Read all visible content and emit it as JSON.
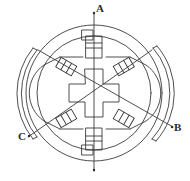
{
  "figure": {
    "kind": "engineering-cross-section",
    "background_color": "#ffffff",
    "line_color": "#3a3a3a",
    "label_color": "#2b2b2b"
  },
  "labels": {
    "a": "A",
    "b": "B",
    "c": "C"
  },
  "axes": [
    {
      "name": "A",
      "label": "A",
      "orientation": "vertical",
      "angle_deg": 90,
      "label_position": "top"
    },
    {
      "name": "B",
      "label": "B",
      "orientation": "diagonal",
      "angle_deg": -30,
      "label_position": "lower-right"
    },
    {
      "name": "C",
      "label": "C",
      "orientation": "diagonal",
      "angle_deg": 210,
      "label_position": "lower-left"
    }
  ],
  "components": {
    "outer_circle": "stator-housing-outer-circle",
    "inner_circle": "stator-core-circle",
    "rotor": "cross-shaped-rotor",
    "arc_left": "left-housing-arc-segment",
    "arc_right": "right-housing-arc-segment",
    "coils": [
      "coil-top",
      "coil-bottom",
      "coil-upper-left",
      "coil-upper-right",
      "coil-lower-left",
      "coil-lower-right"
    ],
    "pole_shoes": [
      "pole-shoe-left",
      "pole-shoe-right"
    ]
  },
  "geometry": {
    "center_x": 94,
    "center_y": 93,
    "outer_radius": 70,
    "inner_radius": 58,
    "core_radius": 48,
    "rotor_half_width": 25
  }
}
